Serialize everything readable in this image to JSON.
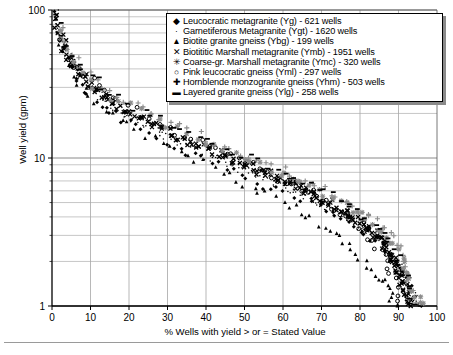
{
  "chart_data": {
    "type": "scatter",
    "title": "",
    "xlabel": "% Wells with yield > or = Stated Value",
    "ylabel": "Well yield (gpm)",
    "xlim": [
      0,
      100
    ],
    "ylim": [
      1,
      100
    ],
    "yscale": "log",
    "xticks": [
      0,
      10,
      20,
      30,
      40,
      50,
      60,
      70,
      80,
      90,
      100
    ],
    "yticks": [
      1,
      10,
      100
    ],
    "grid": true,
    "legend_position": "top-right",
    "series": [
      {
        "name": "Leucocratic metagranite (Yg) - 621 wells",
        "label": "Leucocratic metagranite (Yg)",
        "wells": 621,
        "marker": "small-diamond",
        "glyph": "◆",
        "color": "#000000",
        "x": [
          1,
          2,
          3,
          4,
          6,
          8,
          10,
          13,
          16,
          19,
          23,
          27,
          31,
          35,
          39,
          43,
          47,
          51,
          55,
          59,
          63,
          67,
          70,
          73,
          76,
          79,
          82,
          85,
          87,
          89,
          91,
          93,
          94,
          95
        ],
        "y": [
          100,
          70,
          55,
          45,
          35,
          30,
          26,
          22,
          20,
          18,
          16,
          14,
          12.5,
          11,
          10,
          9,
          8,
          7.2,
          6.5,
          6,
          5.4,
          5,
          4.5,
          4.2,
          3.8,
          3.4,
          3,
          2.6,
          2.3,
          2,
          1.7,
          1.4,
          1.2,
          1
        ]
      },
      {
        "name": "Garnetiferous Metagranite (Ygt) - 1620 wells",
        "label": "Garnetiferous Metagranite (Ygt)",
        "wells": 1620,
        "marker": "tiny-dot",
        "glyph": "·",
        "color": "#000000",
        "x": [
          1,
          2,
          3,
          5,
          7,
          9,
          12,
          15,
          18,
          22,
          26,
          30,
          34,
          38,
          42,
          46,
          50,
          54,
          58,
          62,
          66,
          70,
          73,
          76,
          79,
          82,
          85,
          87,
          89,
          91,
          93,
          94,
          95
        ],
        "y": [
          100,
          72,
          58,
          46,
          38,
          32,
          27,
          23,
          20,
          18,
          16,
          14,
          12.5,
          11,
          10,
          9,
          8.2,
          7.4,
          6.7,
          6,
          5.4,
          5,
          4.5,
          4,
          3.6,
          3.2,
          2.8,
          2.4,
          2.1,
          1.8,
          1.5,
          1.2,
          1
        ]
      },
      {
        "name": "Biotite granite gneiss (Ybg) - 199 wells",
        "label": "Biotite granite gneiss (Ybg)",
        "wells": 199,
        "marker": "triangle",
        "glyph": "▲",
        "color": "#000000",
        "x": [
          2,
          4,
          7,
          10,
          14,
          18,
          22,
          27,
          31,
          36,
          40,
          45,
          49,
          53,
          57,
          61,
          64,
          67,
          70,
          73,
          76,
          78,
          80,
          82,
          84,
          86,
          87,
          88,
          89,
          90
        ],
        "y": [
          60,
          42,
          32,
          26,
          21,
          18,
          15,
          13,
          11.5,
          10,
          9,
          8,
          7,
          6.2,
          5.5,
          5,
          4.4,
          4,
          3.5,
          3.1,
          2.7,
          2.4,
          2.1,
          1.9,
          1.7,
          1.5,
          1.35,
          1.2,
          1.1,
          1
        ]
      },
      {
        "name": "Biotititic Marshall metagranite (Ymb) - 1951 wells",
        "label": "Biotititic Marshall metagranite (Ymb)",
        "wells": 1951,
        "marker": "x-cross",
        "glyph": "✕",
        "color": "#000000",
        "x": [
          1,
          3,
          5,
          8,
          11,
          15,
          19,
          24,
          29,
          34,
          39,
          44,
          49,
          54,
          58,
          62,
          66,
          70,
          74,
          77,
          80,
          83,
          85,
          87,
          89,
          90,
          91,
          92,
          93
        ],
        "y": [
          90,
          58,
          45,
          36,
          30,
          25,
          21,
          18,
          15.5,
          13.5,
          12,
          10.5,
          9.2,
          8.2,
          7.4,
          6.6,
          6,
          5.3,
          4.7,
          4.2,
          3.7,
          3.2,
          2.8,
          2.4,
          2,
          1.7,
          1.45,
          1.2,
          1
        ]
      },
      {
        "name": "Coarse-gr. Marshall metagranite (Ymc) - 320 wells",
        "label": "Coarse-gr. Marshall metagranite (Ymc)",
        "wells": 320,
        "marker": "asterisk",
        "glyph": "✳",
        "color": "#8c8c8c",
        "x": [
          2,
          4,
          7,
          10,
          14,
          19,
          24,
          29,
          34,
          40,
          45,
          50,
          55,
          60,
          64,
          68,
          72,
          76,
          79,
          82,
          85,
          87,
          89,
          91,
          92,
          93,
          94,
          95,
          96
        ],
        "y": [
          75,
          52,
          40,
          33,
          27,
          23,
          19.5,
          17,
          14.5,
          12.5,
          11,
          9.8,
          8.8,
          7.8,
          7,
          6.2,
          5.5,
          4.9,
          4.3,
          3.8,
          3.3,
          2.9,
          2.5,
          2.1,
          1.8,
          1.55,
          1.3,
          1.15,
          1
        ]
      },
      {
        "name": "Pink leucocratic gneiss (Yml) - 297 wells",
        "label": "Pink leucocratic gneiss (Yml)",
        "wells": 297,
        "marker": "open-circle",
        "glyph": "○",
        "color": "#000000",
        "x": [
          2,
          5,
          8,
          12,
          16,
          21,
          26,
          31,
          36,
          41,
          46,
          51,
          55,
          59,
          63,
          67,
          70,
          73,
          76,
          79,
          82,
          84,
          86,
          88,
          89,
          90
        ],
        "y": [
          65,
          46,
          36,
          30,
          25,
          21,
          18,
          15.5,
          13.5,
          12,
          10.5,
          9.3,
          8.3,
          7.4,
          6.6,
          5.9,
          5.2,
          4.6,
          4,
          3.5,
          3,
          2.6,
          2.2,
          1.8,
          1.4,
          1.1
        ]
      },
      {
        "name": "Hornblende monzogranite gneiss (Yhm) - 503 wells",
        "label": "Hornblende monzogranite gneiss (Yhm)",
        "wells": 503,
        "marker": "plus",
        "glyph": "✚",
        "color": "#8c8c8c",
        "x": [
          2,
          4,
          7,
          11,
          15,
          20,
          25,
          30,
          36,
          41,
          46,
          51,
          56,
          61,
          65,
          69,
          73,
          77,
          80,
          83,
          86,
          88,
          90,
          91,
          92,
          93,
          94
        ],
        "y": [
          80,
          55,
          42,
          34,
          28,
          24,
          20,
          17.5,
          15,
          13,
          11.5,
          10,
          9,
          8,
          7.2,
          6.4,
          5.7,
          5,
          4.4,
          3.9,
          3.4,
          2.9,
          2.5,
          2.1,
          1.7,
          1.35,
          1.05
        ]
      },
      {
        "name": "Layered granite gneiss (Ylg) - 258 wells",
        "label": "Layered granite gneiss (Ylg)",
        "wells": 258,
        "marker": "dash",
        "glyph": "▬",
        "color": "#000000",
        "x": [
          1,
          3,
          6,
          9,
          13,
          17,
          22,
          27,
          32,
          37,
          42,
          47,
          52,
          57,
          61,
          65,
          69,
          73,
          77,
          80,
          83,
          86,
          88,
          90,
          91,
          92,
          93,
          94
        ],
        "y": [
          95,
          62,
          47,
          38,
          31,
          26,
          22,
          19,
          16.5,
          14.5,
          12.5,
          11,
          9.8,
          8.7,
          7.8,
          7,
          6.2,
          5.5,
          4.8,
          4.2,
          3.6,
          3.1,
          2.6,
          2.2,
          1.8,
          1.5,
          1.2,
          1
        ]
      }
    ]
  },
  "axes": {
    "xlabel": "% Wells with yield > or = Stated Value",
    "ylabel": "Well yield (gpm)",
    "xticklabels": [
      "0",
      "10",
      "20",
      "30",
      "40",
      "50",
      "60",
      "70",
      "80",
      "90",
      "100"
    ],
    "yticklabels": [
      "1",
      "10",
      "100"
    ]
  },
  "caption": {
    "text": ""
  }
}
